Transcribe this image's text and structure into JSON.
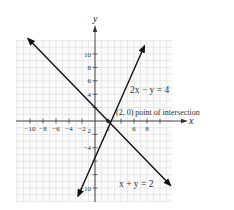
{
  "chart_data": {
    "type": "line",
    "title": "",
    "xlabel": "x",
    "ylabel": "y",
    "xlim": [
      -12,
      12
    ],
    "ylim": [
      -12,
      12
    ],
    "grid": true,
    "x_ticks": [
      -10,
      -8,
      -6,
      -4,
      -2,
      2,
      6,
      8
    ],
    "x_tick_labels": [
      "−10",
      "−8",
      "−6",
      "−4",
      "−2",
      "2",
      "6",
      "8"
    ],
    "y_ticks": [
      10,
      8,
      6,
      4,
      -2,
      -4,
      -10
    ],
    "y_tick_labels": [
      "10",
      "8",
      "6",
      "4",
      "2",
      "−4",
      "−10"
    ],
    "series": [
      {
        "name": "2x − y = 4",
        "equation": "y = 2x - 4",
        "x": [
          -2.6,
          7.6
        ],
        "y": [
          -11.2,
          11.2
        ]
      },
      {
        "name": "x + y = 2",
        "equation": "y = -x + 2",
        "x": [
          -10.3,
          11.6
        ],
        "y": [
          12.3,
          -9.6
        ]
      }
    ],
    "annotations": [
      {
        "text": "(2, 0) point of intersection",
        "x": 2,
        "y": 0
      },
      {
        "text": "2x − y = 4",
        "near_series": 0
      },
      {
        "text": "x + y = 2",
        "near_series": 1
      }
    ]
  },
  "labels": {
    "x_axis": "x",
    "y_axis": "y",
    "eq1": "2x − y = 4",
    "eq2": "x + y = 2",
    "intersection": "(2, 0) point of intersection"
  }
}
